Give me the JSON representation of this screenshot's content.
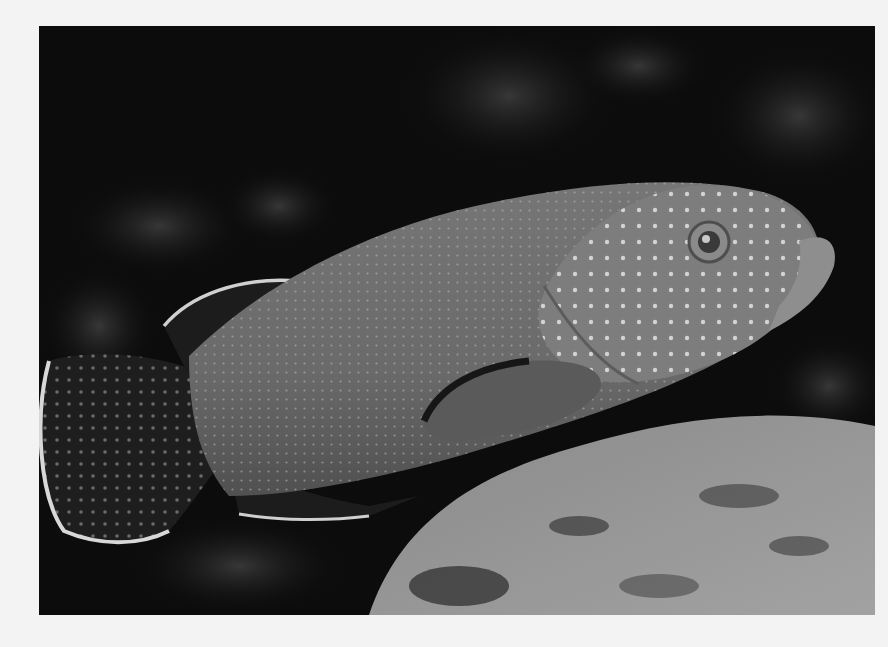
{
  "page": {
    "background": "#f3f3f3"
  },
  "photo": {
    "subject": "spotted grouper fish",
    "style": "black-and-white photograph",
    "colors": {
      "water_dark": "#0c0c0c",
      "fish_body": "#6e6e6e",
      "fish_head": "#7d7d7d",
      "fin_dark": "#1e1e1e",
      "fin_edge": "#d8d8d8",
      "spots": "#e2e2e2",
      "rock_light": "#9a9a9a",
      "rock_dark": "#3a3a3a"
    }
  }
}
